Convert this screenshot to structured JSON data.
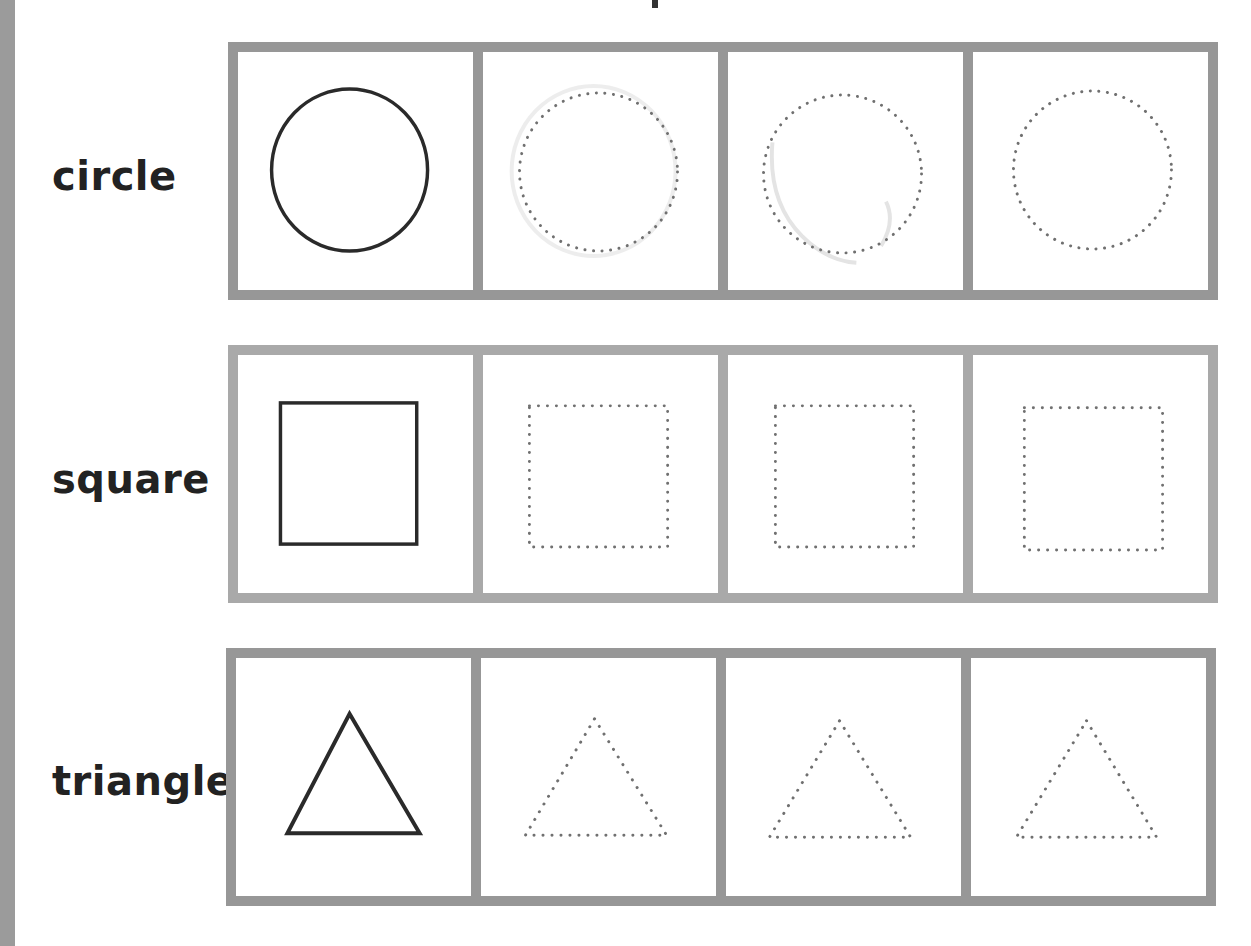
{
  "page": {
    "colors": {
      "frame_border": "#979797",
      "frame_border_light": "#a9a9a9",
      "solid_shape": "#2a2a2a",
      "dotted_shape": "#707070",
      "label_text": "#222222",
      "edge_strip": "#9b9b9b"
    }
  },
  "worksheet": {
    "rows": [
      {
        "label": "circle",
        "shape": "circle",
        "cells": [
          {
            "style": "solid"
          },
          {
            "style": "dotted",
            "note": "faint erased tracing"
          },
          {
            "style": "dotted",
            "note": "faint erased tracing"
          },
          {
            "style": "dotted"
          }
        ]
      },
      {
        "label": "square",
        "shape": "square",
        "cells": [
          {
            "style": "solid"
          },
          {
            "style": "dotted"
          },
          {
            "style": "dotted"
          },
          {
            "style": "dotted"
          }
        ]
      },
      {
        "label": "triangle",
        "shape": "triangle",
        "cells": [
          {
            "style": "solid"
          },
          {
            "style": "dotted"
          },
          {
            "style": "dotted"
          },
          {
            "style": "dotted"
          }
        ]
      }
    ]
  }
}
